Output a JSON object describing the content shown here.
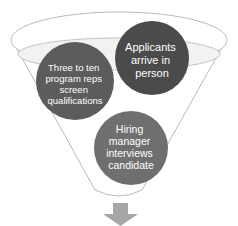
{
  "diagram": {
    "type": "funnel",
    "colors": {
      "outline": "#b9b9b9",
      "inner_fill": "#f2f2f2",
      "circle_screen": "#5c5c5c",
      "circle_arrive": "#4b4b4b",
      "circle_interview": "#6f6f6f",
      "overlap": "#8a8a8a",
      "arrow": "#a6a6a6"
    },
    "circles": [
      {
        "id": "screen",
        "lines": [
          "Three to ten",
          "program reps",
          "screen",
          "qualifications"
        ]
      },
      {
        "id": "arrive",
        "lines": [
          "Applicants",
          "arrive in",
          "person"
        ]
      },
      {
        "id": "interview",
        "lines": [
          "Hiring",
          "manager",
          "interviews",
          "candidate"
        ]
      }
    ],
    "output_arrow": "down-arrow"
  }
}
